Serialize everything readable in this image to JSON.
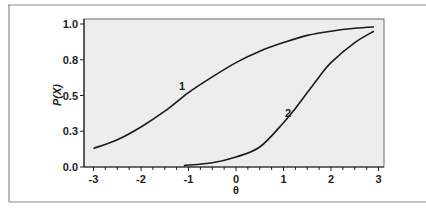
{
  "chart_data": {
    "type": "line",
    "title": "",
    "xlabel": "θ",
    "ylabel": "P(X)",
    "xlim": [
      -3,
      3
    ],
    "ylim": [
      0,
      1
    ],
    "x_ticks": [
      -3,
      -2,
      -1,
      0,
      1,
      2,
      3
    ],
    "x_tick_labels": [
      "-3",
      "-2",
      "-1",
      "0",
      "1",
      "2",
      "3"
    ],
    "x_minor_step": 0.25,
    "y_ticks": [
      0,
      0.25,
      0.5,
      0.75,
      1.0
    ],
    "y_tick_labels": [
      "0.0",
      "0.3",
      "0.5",
      "0.8",
      "1.0"
    ],
    "grid": false,
    "legend": "none (curves labeled inline)",
    "series": [
      {
        "name": "1",
        "x": [
          -3,
          -2.5,
          -2,
          -1.5,
          -1,
          -0.5,
          0,
          0.5,
          1,
          1.5,
          2,
          2.5,
          2.9
        ],
        "y": [
          0.13,
          0.19,
          0.28,
          0.39,
          0.52,
          0.63,
          0.73,
          0.81,
          0.87,
          0.92,
          0.95,
          0.97,
          0.98
        ]
      },
      {
        "name": "2",
        "x": [
          -1.1,
          -0.5,
          0,
          0.5,
          1,
          1.25,
          1.5,
          1.75,
          2,
          2.5,
          2.9
        ],
        "y": [
          0.01,
          0.03,
          0.07,
          0.14,
          0.31,
          0.41,
          0.52,
          0.63,
          0.73,
          0.87,
          0.95
        ]
      }
    ],
    "annotations": [
      {
        "text": "1",
        "x": -1.15,
        "y": 0.57
      },
      {
        "text": "2",
        "x": 1.1,
        "y": 0.38
      }
    ]
  },
  "labels": {
    "xlabel": "θ",
    "ylabel": "P(X)",
    "curve1": "1",
    "curve2": "2"
  },
  "colors": {
    "plot_bg": "#ededed",
    "curve": "#1a1a1a",
    "frame": "#8a8a8a"
  }
}
